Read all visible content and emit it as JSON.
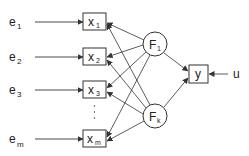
{
  "diagram": {
    "inputs": [
      {
        "label": "e",
        "sub": "1"
      },
      {
        "label": "e",
        "sub": "2"
      },
      {
        "label": "e",
        "sub": "3"
      },
      {
        "label": "e",
        "sub": "m"
      }
    ],
    "states": [
      {
        "label": "x",
        "sub": "1"
      },
      {
        "label": "x",
        "sub": "2"
      },
      {
        "label": "x",
        "sub": "3"
      },
      {
        "label": "x",
        "sub": "m"
      }
    ],
    "functions": [
      {
        "label": "F",
        "sub": "1"
      },
      {
        "label": "F",
        "sub": "k"
      }
    ],
    "output": {
      "label": "y"
    },
    "control": {
      "label": "u"
    },
    "ellipsis": "⋮",
    "colors": {
      "stroke": "#333333",
      "text": "#222222",
      "background": "#ffffff"
    }
  }
}
